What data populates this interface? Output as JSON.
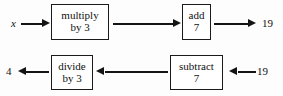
{
  "diagram": {
    "colors": {
      "ink": "#141414",
      "background": "#fdfdfd",
      "box_border": "#1a1a1a"
    },
    "top_row": {
      "input_label": "x",
      "boxes": [
        {
          "line1": "multiply",
          "line2": "by 3"
        },
        {
          "line1": "add",
          "line2": "7"
        }
      ],
      "output_label": "19"
    },
    "bottom_row": {
      "output_label": "4",
      "boxes": [
        {
          "line1": "divide",
          "line2": "by 3"
        },
        {
          "line1": "subtract",
          "line2": "7"
        }
      ],
      "input_label": "19"
    }
  }
}
